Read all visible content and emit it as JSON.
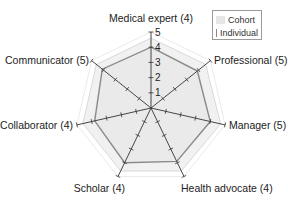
{
  "chart_data": {
    "type": "radar",
    "title": "",
    "categories": [
      "Medical expert (4)",
      "Professional (5)",
      "Manager (5)",
      "Health advocate (4)",
      "Scholar (4)",
      "Collaborator (4)",
      "Communicator (5)"
    ],
    "rlim": [
      0,
      5
    ],
    "r_ticks": [
      "1",
      "2",
      "3",
      "4",
      "5"
    ],
    "series": [
      {
        "name": "Cohort",
        "color": "#e6e6e6",
        "stroke": "#d0d0d0",
        "values": [
          4.6,
          4.6,
          4.7,
          4.6,
          4.6,
          4.6,
          4.6
        ]
      },
      {
        "name": "Individual",
        "color": "#8a8a8a",
        "stroke": "#8a8a8a",
        "values": [
          4.0,
          3.9,
          4.0,
          3.9,
          4.0,
          3.8,
          4.1
        ]
      }
    ],
    "legend_position": "top-right",
    "grid": true
  },
  "legend": {
    "items": [
      {
        "label": "Cohort",
        "color": "#e6e6e6"
      },
      {
        "label": "Individual",
        "color": "#8a8a8a"
      }
    ]
  }
}
